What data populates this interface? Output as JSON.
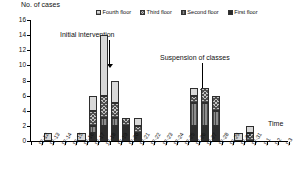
{
  "chart_data": {
    "type": "bar",
    "title": "",
    "ylabel": "No. of cases",
    "xlabel": "Time",
    "ylim": [
      0,
      16
    ],
    "yticks": [
      0,
      2,
      4,
      6,
      8,
      10,
      12,
      14,
      16
    ],
    "grid": false,
    "stacked": true,
    "legend_position": "top-right",
    "categories": [
      "12-12",
      "12-13",
      "12-14",
      "12-15",
      "12-16",
      "12-17",
      "12-18",
      "12-19",
      "12-20",
      "12-21",
      "12-22",
      "12-23",
      "12-24",
      "12-25",
      "12-26",
      "12-27",
      "12-28",
      "12-29",
      "12-30",
      "12-31",
      "1-1",
      "1-2",
      "1-3"
    ],
    "series": [
      {
        "name": "First floor",
        "pattern": "solid-black",
        "values": [
          0,
          0,
          0,
          0,
          0,
          1,
          2,
          2,
          2,
          1,
          0,
          0,
          0,
          0,
          2,
          2,
          2,
          0,
          0,
          0,
          0,
          0,
          0
        ]
      },
      {
        "name": "Second floor",
        "pattern": "vertical-lines",
        "values": [
          0,
          0,
          0,
          0,
          0,
          1,
          1,
          1,
          0,
          0,
          0,
          0,
          0,
          0,
          3,
          3,
          2,
          0,
          0,
          0,
          0,
          0,
          0
        ]
      },
      {
        "name": "Third floor",
        "pattern": "checker",
        "values": [
          0,
          0,
          0,
          0,
          0,
          2,
          3,
          2,
          1,
          1,
          0,
          0,
          0,
          0,
          1,
          2,
          2,
          0,
          0,
          1,
          0,
          0,
          0
        ]
      },
      {
        "name": "Fourth floor",
        "pattern": "fine-grid",
        "values": [
          0,
          1,
          0,
          0,
          1,
          2,
          8,
          3,
          0,
          1,
          0,
          0,
          0,
          0,
          1,
          0,
          0,
          0,
          1,
          1,
          0,
          0,
          0
        ]
      }
    ],
    "totals": [
      0,
      1,
      0,
      0,
      1,
      6,
      14,
      8,
      3,
      3,
      0,
      0,
      0,
      0,
      7,
      7,
      6,
      0,
      1,
      2,
      0,
      0,
      0
    ],
    "annotations": [
      {
        "text": "Initial intervention",
        "points_to": "12-18"
      },
      {
        "text": "Suspension of classes",
        "points_to": "12-26"
      }
    ]
  },
  "legend": {
    "items": [
      {
        "label": "Fourth floor"
      },
      {
        "label": "Third floor"
      },
      {
        "label": "Second floor"
      },
      {
        "label": "First floor"
      }
    ]
  }
}
